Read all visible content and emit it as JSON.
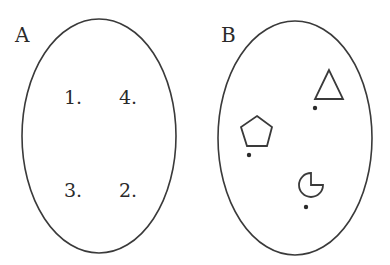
{
  "panels": [
    {
      "label": "A",
      "items": [
        {
          "text": "1.",
          "x": 64,
          "y": 104
        },
        {
          "text": "4.",
          "x": 119,
          "y": 104
        },
        {
          "text": "3.",
          "x": 64,
          "y": 197
        },
        {
          "text": "2.",
          "x": 119,
          "y": 197
        }
      ]
    },
    {
      "label": "B",
      "items": [
        {
          "shape": "triangle"
        },
        {
          "shape": "pentagon"
        },
        {
          "shape": "pac-man"
        }
      ]
    }
  ],
  "colors": {
    "stroke": "#3a3a3a",
    "background": "#ffffff"
  }
}
